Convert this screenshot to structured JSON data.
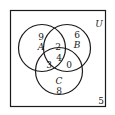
{
  "diagram": {
    "type": "venn-3",
    "universe_label": "U",
    "sets": [
      {
        "name": "A",
        "label": "A"
      },
      {
        "name": "B",
        "label": "B"
      },
      {
        "name": "C",
        "label": "C"
      }
    ],
    "regions": {
      "only_A": "9",
      "only_B": "6",
      "only_C": "8",
      "A_and_B_only": "2",
      "A_and_C_only": "3",
      "B_and_C_only": "0",
      "A_B_C": "4",
      "outside": "5"
    },
    "colors": {
      "stroke": "#1a1a1a",
      "background": "#ffffff"
    }
  }
}
